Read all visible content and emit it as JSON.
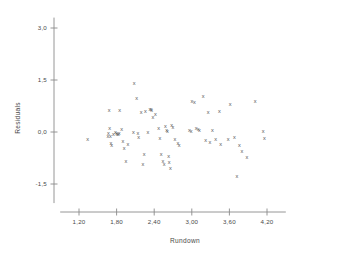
{
  "chart_data": {
    "type": "scatter",
    "title": "",
    "xlabel": "Rundown",
    "ylabel": "Residuals",
    "xlim": [
      0.9,
      4.5
    ],
    "ylim": [
      -2.05,
      3.3
    ],
    "xticks": [
      1.2,
      1.8,
      2.4,
      3.0,
      3.6,
      4.2
    ],
    "xticklabels": [
      "1,20",
      "1,80",
      "2,40",
      "3,00",
      "3,60",
      "4,20"
    ],
    "yticks": [
      3.0,
      1.5,
      0.0,
      -1.5
    ],
    "yticklabels": [
      "3,0",
      "1,5",
      "0,0",
      "-1,5"
    ],
    "grid": false,
    "legend": null,
    "marker": "x",
    "marker_color": "#555555",
    "axis_color": "#8a8a8a",
    "background": "#ffffff",
    "point_count": 76,
    "points": [
      {
        "x": 1.34,
        "y": -0.21
      },
      {
        "x": 1.68,
        "y": 0.62
      },
      {
        "x": 1.69,
        "y": 0.09
      },
      {
        "x": 1.67,
        "y": -0.04
      },
      {
        "x": 1.7,
        "y": -0.14
      },
      {
        "x": 1.71,
        "y": -0.34
      },
      {
        "x": 1.72,
        "y": -0.38
      },
      {
        "x": 1.75,
        "y": -0.07
      },
      {
        "x": 1.78,
        "y": -0.02
      },
      {
        "x": 1.8,
        "y": -0.05
      },
      {
        "x": 1.81,
        "y": -0.08
      },
      {
        "x": 1.83,
        "y": -0.06
      },
      {
        "x": 1.84,
        "y": -0.03
      },
      {
        "x": 1.85,
        "y": 0.63
      },
      {
        "x": 1.88,
        "y": 0.06
      },
      {
        "x": 1.9,
        "y": -0.27
      },
      {
        "x": 1.92,
        "y": -0.49
      },
      {
        "x": 1.95,
        "y": -0.86
      },
      {
        "x": 1.98,
        "y": -0.36
      },
      {
        "x": 2.07,
        "y": -0.02
      },
      {
        "x": 2.08,
        "y": 1.4
      },
      {
        "x": 2.12,
        "y": 0.97
      },
      {
        "x": 2.14,
        "y": -0.03
      },
      {
        "x": 2.15,
        "y": -0.17
      },
      {
        "x": 2.22,
        "y": -0.93
      },
      {
        "x": 2.24,
        "y": -0.65
      },
      {
        "x": 2.26,
        "y": 0.58
      },
      {
        "x": 2.3,
        "y": -0.02
      },
      {
        "x": 2.33,
        "y": 0.64
      },
      {
        "x": 2.35,
        "y": 0.66
      },
      {
        "x": 2.36,
        "y": 0.62
      },
      {
        "x": 2.38,
        "y": 0.43
      },
      {
        "x": 2.47,
        "y": 0.1
      },
      {
        "x": 2.49,
        "y": -0.19
      },
      {
        "x": 2.51,
        "y": -0.66
      },
      {
        "x": 2.54,
        "y": -0.85
      },
      {
        "x": 2.56,
        "y": -0.93
      },
      {
        "x": 2.58,
        "y": 0.16
      },
      {
        "x": 2.6,
        "y": 0.03
      },
      {
        "x": 2.61,
        "y": 0.01
      },
      {
        "x": 2.63,
        "y": -0.72
      },
      {
        "x": 2.64,
        "y": -0.88
      },
      {
        "x": 2.66,
        "y": -1.06
      },
      {
        "x": 2.68,
        "y": 0.18
      },
      {
        "x": 2.7,
        "y": 0.12
      },
      {
        "x": 2.73,
        "y": -0.21
      },
      {
        "x": 2.78,
        "y": -0.33
      },
      {
        "x": 2.8,
        "y": -0.4
      },
      {
        "x": 2.96,
        "y": 0.05
      },
      {
        "x": 2.99,
        "y": 0.02
      },
      {
        "x": 3.0,
        "y": 0.87
      },
      {
        "x": 3.04,
        "y": 0.85
      },
      {
        "x": 3.07,
        "y": 0.09
      },
      {
        "x": 3.1,
        "y": 0.07
      },
      {
        "x": 3.12,
        "y": 0.05
      },
      {
        "x": 3.18,
        "y": 1.03
      },
      {
        "x": 3.22,
        "y": -0.26
      },
      {
        "x": 3.26,
        "y": 0.56
      },
      {
        "x": 3.29,
        "y": -0.31
      },
      {
        "x": 3.38,
        "y": -0.21
      },
      {
        "x": 3.44,
        "y": 0.6
      },
      {
        "x": 3.46,
        "y": -0.36
      },
      {
        "x": 3.58,
        "y": -0.23
      },
      {
        "x": 3.61,
        "y": 0.8
      },
      {
        "x": 3.68,
        "y": -0.17
      },
      {
        "x": 3.72,
        "y": -1.27
      },
      {
        "x": 3.76,
        "y": -0.4
      },
      {
        "x": 3.8,
        "y": -0.56
      },
      {
        "x": 3.88,
        "y": -0.75
      },
      {
        "x": 4.01,
        "y": 0.88
      },
      {
        "x": 4.14,
        "y": 0.01
      },
      {
        "x": 4.16,
        "y": -0.2
      },
      {
        "x": 2.42,
        "y": 0.5
      },
      {
        "x": 1.66,
        "y": -0.12
      },
      {
        "x": 2.19,
        "y": 0.56
      },
      {
        "x": 3.33,
        "y": 0.03
      }
    ]
  }
}
